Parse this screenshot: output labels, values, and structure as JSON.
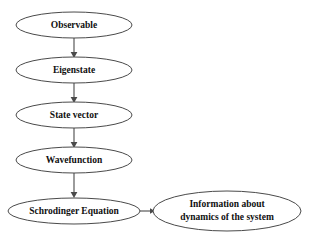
{
  "diagram": {
    "background_color": "#ffffff",
    "stroke_color": "#4a4a4a",
    "text_color": "#101010",
    "nodes": [
      {
        "id": "observable",
        "label": "Observable",
        "shape": "ellipse",
        "cx": 74,
        "cy": 25,
        "rx": 58,
        "ry": 13,
        "font_size": 9.5,
        "lines": [
          "Observable"
        ]
      },
      {
        "id": "eigenstate",
        "label": "Eigenstate",
        "shape": "ellipse",
        "cx": 74,
        "cy": 70,
        "rx": 58,
        "ry": 13,
        "font_size": 9.5,
        "lines": [
          "Eigenstate"
        ]
      },
      {
        "id": "state-vector",
        "label": "State vector",
        "shape": "ellipse",
        "cx": 74,
        "cy": 115,
        "rx": 58,
        "ry": 13,
        "font_size": 9.5,
        "lines": [
          "State vector"
        ]
      },
      {
        "id": "wavefunction",
        "label": "Wavefunction",
        "shape": "ellipse",
        "cx": 74,
        "cy": 160,
        "rx": 58,
        "ry": 13,
        "font_size": 9.5,
        "lines": [
          "Wavefunction"
        ]
      },
      {
        "id": "schrodinger-equation",
        "label": "Schrodinger Equation",
        "shape": "ellipse",
        "cx": 74,
        "cy": 211,
        "rx": 66,
        "ry": 13,
        "font_size": 9.5,
        "lines": [
          "Schrodinger Equation"
        ]
      },
      {
        "id": "information-about-dynamics",
        "label": "Information about dynamics of the system",
        "shape": "ellipse",
        "cx": 227,
        "cy": 211,
        "rx": 74,
        "ry": 20,
        "font_size": 9.5,
        "lines": [
          "Information about",
          "dynamics of the system"
        ]
      }
    ],
    "edges": [
      {
        "id": "observable-to-eigenstate",
        "from": "observable",
        "to": "eigenstate",
        "direction": "down",
        "x1": 74,
        "y1": 38,
        "x2": 74,
        "y2": 57
      },
      {
        "id": "eigenstate-to-state-vector",
        "from": "eigenstate",
        "to": "state-vector",
        "direction": "down",
        "x1": 74,
        "y1": 83,
        "x2": 74,
        "y2": 102
      },
      {
        "id": "state-vector-to-wavefunction",
        "from": "state-vector",
        "to": "wavefunction",
        "direction": "down",
        "x1": 74,
        "y1": 128,
        "x2": 74,
        "y2": 147
      },
      {
        "id": "wavefunction-to-schrodinger-equation",
        "from": "wavefunction",
        "to": "schrodinger-equation",
        "direction": "down",
        "x1": 74,
        "y1": 173,
        "x2": 74,
        "y2": 198
      },
      {
        "id": "schrodinger-equation-to-information",
        "from": "schrodinger-equation",
        "to": "information-about-dynamics",
        "direction": "right",
        "x1": 140,
        "y1": 211,
        "x2": 153,
        "y2": 211
      }
    ]
  }
}
